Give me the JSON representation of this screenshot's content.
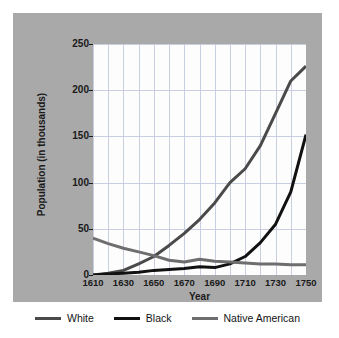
{
  "figure": {
    "panel_color": "#a9a9a9",
    "plot_background": "#fdfdfd",
    "gridline_color": "#c9cfe0"
  },
  "chart_data": {
    "type": "line",
    "title": "",
    "xlabel": "Year",
    "ylabel": "Population (in thousands)",
    "xlim": [
      1610,
      1750
    ],
    "ylim": [
      0,
      250
    ],
    "grid": true,
    "legend_position": "bottom",
    "x_tick_labels": [
      "1610",
      "1630",
      "1650",
      "1670",
      "1690",
      "1710",
      "1730",
      "1750"
    ],
    "x_ticks": [
      1610,
      1630,
      1650,
      1670,
      1690,
      1710,
      1730,
      1750
    ],
    "x_gridlines": [
      1610,
      1620,
      1630,
      1640,
      1650,
      1660,
      1670,
      1680,
      1690,
      1700,
      1710,
      1720,
      1730,
      1740,
      1750
    ],
    "y_tick_labels": [
      "0",
      "50",
      "100",
      "150",
      "200",
      "250"
    ],
    "y_ticks": [
      0,
      50,
      100,
      150,
      200,
      250
    ],
    "x": [
      1610,
      1620,
      1630,
      1640,
      1650,
      1660,
      1670,
      1680,
      1690,
      1700,
      1710,
      1720,
      1730,
      1740,
      1750
    ],
    "series": [
      {
        "name": "White",
        "color": "#4a4a4a",
        "values": [
          0,
          2,
          5,
          12,
          20,
          32,
          45,
          60,
          78,
          100,
          115,
          140,
          175,
          210,
          226
        ]
      },
      {
        "name": "Black",
        "color": "#111111",
        "values": [
          0,
          1,
          2,
          3,
          5,
          6,
          7,
          9,
          8,
          12,
          20,
          35,
          55,
          90,
          152
        ]
      },
      {
        "name": "Native American",
        "color": "#6e6e6e",
        "values": [
          40,
          34,
          29,
          25,
          21,
          16,
          14,
          17,
          15,
          14,
          13,
          12,
          12,
          11,
          11
        ]
      }
    ]
  },
  "legend": {
    "items": [
      {
        "label": "White",
        "color": "#4a4a4a"
      },
      {
        "label": "Black",
        "color": "#111111"
      },
      {
        "label": "Native American",
        "color": "#6e6e6e"
      }
    ]
  }
}
